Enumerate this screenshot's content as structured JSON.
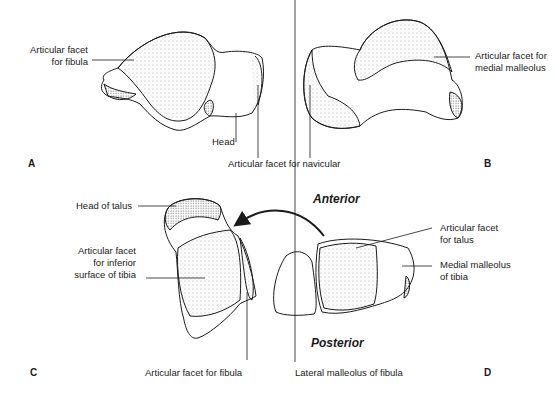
{
  "panels": {
    "A": "A",
    "B": "B",
    "C": "C",
    "D": "D"
  },
  "orientation": {
    "anterior": "Anterior",
    "posterior": "Posterior"
  },
  "labels": {
    "a_fibula_1": "Articular facet",
    "a_fibula_2": "for fibula",
    "a_head": "Head",
    "ab_navicular": "Articular facet for navicular",
    "b_medial_1": "Articular facet for",
    "b_medial_2": "medial malleolus",
    "c_head_talus": "Head of talus",
    "c_tibia_1": "Articular facet",
    "c_tibia_2": "for inferior",
    "c_tibia_3": "surface of tibia",
    "c_fibula": "Articular facet for fibula",
    "d_talus_1": "Articular facet",
    "d_talus_2": "for talus",
    "d_medial_1": "Medial malleolus",
    "d_medial_2": "of tibia",
    "d_lateral": "Lateral malleolus of fibula"
  },
  "colors": {
    "ink": "#1a1a1a",
    "stipple": "#555555",
    "background": "#ffffff"
  }
}
